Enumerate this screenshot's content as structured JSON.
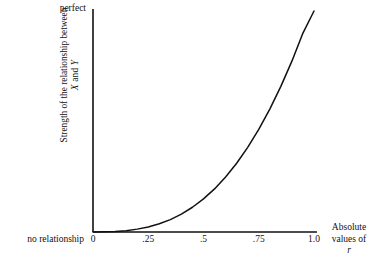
{
  "figure": {
    "background_color": "#ffffff",
    "line_color": "#111111",
    "axis_color": "#111111"
  },
  "axes": {
    "x": {
      "title_line1": "Absolute",
      "title_line2": "values of",
      "title_line3": "r",
      "origin_label": "no relationship",
      "tick_labels": [
        "0",
        ".25",
        ".5",
        ".75",
        "1.0"
      ],
      "tick_values": [
        0,
        0.25,
        0.5,
        0.75,
        1.0
      ],
      "range": [
        0,
        1.0
      ]
    },
    "y": {
      "title_line1": "Strength of the relationship between",
      "title_line2": "X and Y",
      "top_label": "perfect",
      "bottom_label": "no relationship",
      "range": [
        0,
        1.0
      ]
    }
  },
  "chart_data": {
    "type": "line",
    "title": "",
    "xlabel": "Absolute values of r",
    "ylabel": "Strength of the relationship between X and Y",
    "xlim": [
      0,
      1.0
    ],
    "ylim": [
      0,
      1.0
    ],
    "grid": false,
    "legend": "none",
    "xtick_labels": [
      "0",
      ".25",
      ".5",
      ".75",
      "1.0"
    ],
    "xticks": [
      0,
      0.25,
      0.5,
      0.75,
      1.0
    ],
    "ytick_labels": [
      "no relationship",
      "perfect"
    ],
    "yticks": [
      0,
      1.0
    ],
    "annotations": [
      {
        "text": "perfect",
        "position": "y-axis-top"
      },
      {
        "text": "no relationship",
        "position": "x-axis-origin"
      }
    ],
    "series": [
      {
        "name": "strength of relationship",
        "description": "monotonically increasing accelerating curve, approximately y = x^2.7, from (0,0) to (1,1)",
        "x": [
          0.0,
          0.05,
          0.1,
          0.15,
          0.2,
          0.25,
          0.3,
          0.35,
          0.4,
          0.45,
          0.5,
          0.55,
          0.6,
          0.65,
          0.7,
          0.75,
          0.8,
          0.85,
          0.9,
          0.95,
          1.0
        ],
        "values": [
          0.0,
          0.001,
          0.002,
          0.006,
          0.013,
          0.023,
          0.037,
          0.056,
          0.081,
          0.112,
          0.15,
          0.195,
          0.249,
          0.311,
          0.383,
          0.464,
          0.556,
          0.659,
          0.773,
          0.9,
          1.0
        ]
      }
    ]
  }
}
